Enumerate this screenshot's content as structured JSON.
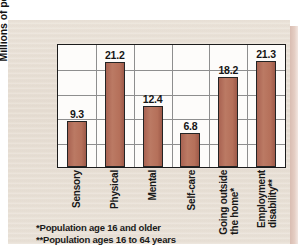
{
  "chart_data": {
    "type": "bar",
    "title": "",
    "xlabel": "",
    "ylabel": "Millions of people",
    "ylim": [
      0,
      25
    ],
    "ytick_step": 5,
    "yticks": [
      "25",
      "20",
      "15",
      "10",
      "5",
      "0"
    ],
    "grid": true,
    "legend": "none",
    "categories": [
      "Sensory",
      "Physical",
      "Mental",
      "Self-care",
      "Going outside\nthe home*",
      "Employment\ndisability**"
    ],
    "values": [
      9.3,
      21.2,
      12.4,
      6.8,
      18.2,
      21.3
    ],
    "value_labels": [
      "9.3",
      "21.2",
      "12.4",
      "6.8",
      "18.2",
      "21.3"
    ],
    "bar_color": "#b5705a",
    "plot_bg": "#fdfcfa",
    "page_bg": "#e8e0d6"
  },
  "footnotes": {
    "line1": "*Population age 16 and older",
    "line2": "**Population ages 16 to 64 years"
  }
}
